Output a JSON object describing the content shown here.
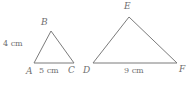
{
  "figure": {
    "background_color": "#ffffff",
    "stroke_color": "#7b7b7b",
    "text_color": "#6f6f6f",
    "triangles": [
      {
        "name": "triangle-abc",
        "vertices": {
          "A": {
            "label": "A",
            "x": 34,
            "y": 63
          },
          "B": {
            "label": "B",
            "x": 51,
            "y": 31
          },
          "C": {
            "label": "C",
            "x": 74,
            "y": 63
          }
        },
        "measurements": {
          "side_ab": "4 cm",
          "side_ac": "5 cm"
        }
      },
      {
        "name": "triangle-def",
        "vertices": {
          "D": {
            "label": "D",
            "x": 93,
            "y": 63
          },
          "E": {
            "label": "E",
            "x": 129,
            "y": 17
          },
          "F": {
            "label": "F",
            "x": 177,
            "y": 63
          }
        },
        "measurements": {
          "side_df": "9 cm"
        }
      }
    ]
  }
}
